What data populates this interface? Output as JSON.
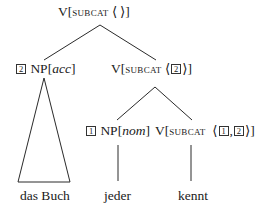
{
  "tree": {
    "root": {
      "cat": "V",
      "feature": "subcat",
      "list_open": "⟨",
      "list_close": "⟩",
      "values": []
    },
    "left": {
      "tag": "2",
      "cat": "NP",
      "case": "acc",
      "yield": "das Buch",
      "collapsed": true
    },
    "right": {
      "cat": "V",
      "feature": "subcat",
      "list_open": "⟨",
      "list_close": "⟩",
      "tag": "2",
      "children": {
        "left": {
          "tag": "1",
          "cat": "NP",
          "case": "nom",
          "word": "jeder"
        },
        "right": {
          "cat": "V",
          "feature": "subcat",
          "list_open": "⟨",
          "list_close": "⟩",
          "tag1": "1",
          "separator": ",",
          "tag2": "2",
          "word": "kennt"
        }
      }
    },
    "brackets": {
      "open": "[",
      "close": "]"
    }
  }
}
